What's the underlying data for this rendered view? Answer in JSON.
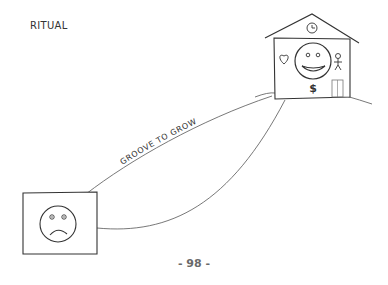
{
  "title": "RITUAL",
  "arrow_label": "GROOVE TO GROW",
  "page_number": "- 98 -",
  "elements": {
    "start_box": {
      "description": "square frame with sad face",
      "icon": "sad-face-icon"
    },
    "house": {
      "description": "house with happy face",
      "roof_icon": "clock-icon",
      "left_icon": "heart-icon",
      "center_icon": "happy-face-icon",
      "right_icon": "stick-figure-icon",
      "bottom_symbol": "$",
      "door_icon": "door-icon"
    }
  },
  "colors": {
    "ink": "#333333",
    "line": "#555555",
    "page_number": "#6a6a6a"
  }
}
